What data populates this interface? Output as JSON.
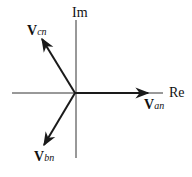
{
  "diagram": {
    "type": "phasor",
    "axes": {
      "horizontal_label": "Re",
      "vertical_label": "Im"
    },
    "phasors": [
      {
        "name": "V",
        "subscript": "an",
        "angle_deg": 0
      },
      {
        "name": "V",
        "subscript": "bn",
        "angle_deg": -120
      },
      {
        "name": "V",
        "subscript": "cn",
        "angle_deg": 120
      }
    ],
    "colors": {
      "line": "#1a1a1a",
      "background": "#ffffff"
    }
  }
}
